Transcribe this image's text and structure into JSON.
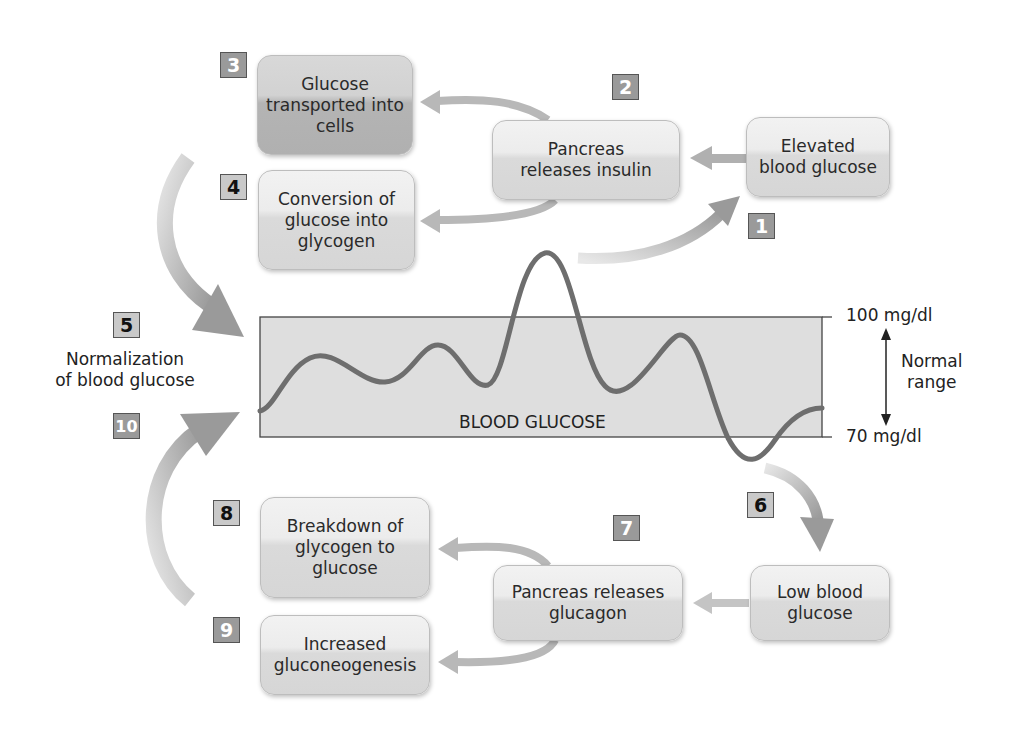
{
  "diagram": {
    "colors": {
      "arrow": "#a8a8a8",
      "curve": "#6e6e6e",
      "band": "#dcdcdc",
      "box_light": "#e4e4e4",
      "box_dark": "#c0c0c0",
      "badge_dark": "#9a9a9a",
      "badge_light": "#c9c9c9"
    },
    "steps": [
      {
        "number": "1",
        "text": "Elevated blood glucose",
        "lines": [
          "Elevated",
          "blood glucose"
        ]
      },
      {
        "number": "2",
        "text": "Pancreas releases insulin",
        "lines": [
          "Pancreas",
          "releases insulin"
        ]
      },
      {
        "number": "3",
        "text": "Glucose transported into cells",
        "lines": [
          "Glucose",
          "transported into",
          "cells"
        ]
      },
      {
        "number": "4",
        "text": "Conversion of glucose into glycogen",
        "lines": [
          "Conversion of",
          "glucose into",
          "glycogen"
        ]
      },
      {
        "number": "5",
        "text": "Normalization of blood glucose",
        "lines": [
          "Normalization",
          "of blood glucose"
        ]
      },
      {
        "number": "6",
        "text": "Low blood glucose",
        "lines": [
          "Low blood",
          "glucose"
        ]
      },
      {
        "number": "7",
        "text": "Pancreas releases glucagon",
        "lines": [
          "Pancreas releases",
          "glucagon"
        ]
      },
      {
        "number": "8",
        "text": "Breakdown of glycogen to glucose",
        "lines": [
          "Breakdown of",
          "glycogen to",
          "glucose"
        ]
      },
      {
        "number": "9",
        "text": "Increased gluconeogenesis",
        "lines": [
          "Increased",
          "gluconeogenesis"
        ]
      },
      {
        "number": "10",
        "text": "Normalization of blood glucose"
      }
    ],
    "chart": {
      "label": "BLOOD GLUCOSE",
      "upper_limit": "100 mg/dl",
      "lower_limit": "70 mg/dl",
      "range_label": [
        "Normal",
        "range"
      ]
    }
  }
}
